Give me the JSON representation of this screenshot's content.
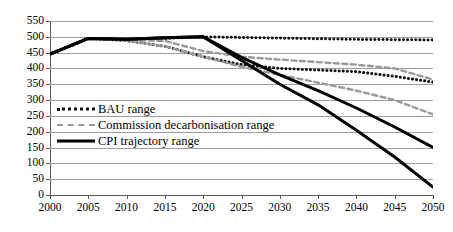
{
  "chart_data": {
    "type": "line",
    "title": "",
    "xlabel": "",
    "ylabel": "",
    "xlim": [
      2000,
      2050
    ],
    "ylim": [
      0,
      550
    ],
    "ytick_step": 50,
    "xtick_step": 5,
    "grid": true,
    "legend_position": "inside-left",
    "x": [
      2000,
      2005,
      2010,
      2015,
      2020,
      2025,
      2030,
      2035,
      2040,
      2045,
      2050
    ],
    "xticklabels": [
      "2000",
      "2005",
      "2010",
      "2015",
      "2020",
      "2025",
      "2030",
      "2035",
      "2040",
      "2045",
      "2050"
    ],
    "yticklabels": [
      "0",
      "50",
      "100",
      "150",
      "200",
      "250",
      "300",
      "350",
      "400",
      "450",
      "500",
      "550"
    ],
    "series": [
      {
        "name": "BAU range upper",
        "legend": "BAU range",
        "style": "dotted",
        "color": "#111111",
        "values": [
          445,
          495,
          492,
          495,
          500,
          498,
          496,
          494,
          492,
          491,
          490
        ]
      },
      {
        "name": "BAU range lower",
        "legend": "BAU range",
        "style": "dotted",
        "color": "#111111",
        "values": [
          445,
          495,
          488,
          470,
          437,
          412,
          400,
          395,
          390,
          375,
          357
        ]
      },
      {
        "name": "Commission decarbonisation range upper",
        "legend": "Commission decarbonisation range",
        "style": "dashed",
        "color": "#9a9a9a",
        "values": [
          445,
          495,
          490,
          487,
          455,
          437,
          428,
          420,
          412,
          400,
          365
        ]
      },
      {
        "name": "Commission decarbonisation range lower",
        "legend": "Commission decarbonisation range",
        "style": "dashed",
        "color": "#9a9a9a",
        "values": [
          445,
          495,
          488,
          470,
          437,
          405,
          380,
          355,
          330,
          300,
          255
        ]
      },
      {
        "name": "CPI trajectory range upper",
        "legend": "CPI trajectory range",
        "style": "solid",
        "color": "#000000",
        "values": [
          445,
          495,
          492,
          497,
          500,
          435,
          380,
          330,
          275,
          215,
          150
        ]
      },
      {
        "name": "CPI trajectory range lower",
        "legend": "CPI trajectory range",
        "style": "solid",
        "color": "#000000",
        "values": [
          445,
          495,
          492,
          497,
          500,
          425,
          350,
          285,
          205,
          120,
          25
        ]
      }
    ],
    "legend_entries": [
      {
        "label": "BAU range",
        "style": "dotted",
        "color": "#111111"
      },
      {
        "label": "Commission decarbonisation range",
        "style": "dashed",
        "color": "#9a9a9a"
      },
      {
        "label": "CPI trajectory range",
        "style": "solid",
        "color": "#000000"
      }
    ]
  }
}
